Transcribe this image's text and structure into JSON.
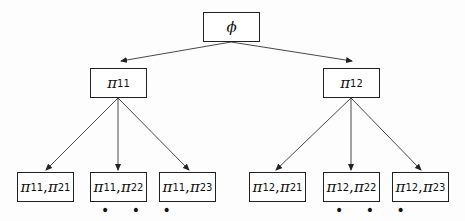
{
  "diagram": {
    "type": "tree",
    "root": {
      "id": "root",
      "label": "ϕ"
    },
    "level1": [
      {
        "id": "n11",
        "symbol": "π",
        "sub": "11"
      },
      {
        "id": "n12",
        "symbol": "π",
        "sub": "12"
      }
    ],
    "level2": [
      {
        "id": "n11_21",
        "parent": "n11",
        "a_sym": "π",
        "a_sub": "11",
        "sep": ",",
        "b_sym": "π",
        "b_sub": "21"
      },
      {
        "id": "n11_22",
        "parent": "n11",
        "a_sym": "π",
        "a_sub": "11",
        "sep": ",",
        "b_sym": "π",
        "b_sub": "22"
      },
      {
        "id": "n11_23",
        "parent": "n11",
        "a_sym": "π",
        "a_sub": "11",
        "sep": ",",
        "b_sym": "π",
        "b_sub": "23"
      },
      {
        "id": "n12_21",
        "parent": "n12",
        "a_sym": "π",
        "a_sub": "12",
        "sep": ",",
        "b_sym": "π",
        "b_sub": "21"
      },
      {
        "id": "n12_22",
        "parent": "n12",
        "a_sym": "π",
        "a_sub": "12",
        "sep": ",",
        "b_sym": "π",
        "b_sub": "22"
      },
      {
        "id": "n12_23",
        "parent": "n12",
        "a_sym": "π",
        "a_sub": "12",
        "sep": ",",
        "b_sym": "π",
        "b_sub": "23"
      }
    ],
    "continuation": "• • •",
    "edges": [
      [
        "root",
        "n11"
      ],
      [
        "root",
        "n12"
      ],
      [
        "n11",
        "n11_21"
      ],
      [
        "n11",
        "n11_22"
      ],
      [
        "n11",
        "n11_23"
      ],
      [
        "n12",
        "n12_21"
      ],
      [
        "n12",
        "n12_22"
      ],
      [
        "n12",
        "n12_23"
      ]
    ]
  }
}
